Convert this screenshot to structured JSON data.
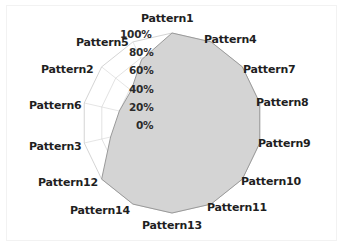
{
  "chart_data": {
    "type": "radar",
    "title": "",
    "subtitle": "",
    "xlabel": "",
    "ylabel": "",
    "grid": true,
    "legend": "none",
    "rlim": [
      0,
      100
    ],
    "tick_labels": [
      "0%",
      "20%",
      "40%",
      "60%",
      "80%",
      "100%"
    ],
    "tick_values": [
      0,
      20,
      40,
      60,
      80,
      100
    ],
    "categories": [
      "Pattern1",
      "Pattern4",
      "Pattern7",
      "Pattern8",
      "Pattern9",
      "Pattern10",
      "Pattern11",
      "Pattern13",
      "Pattern14",
      "Pattern12",
      "Pattern3",
      "Pattern6",
      "Pattern2",
      "Pattern5"
    ],
    "values": [
      100,
      100,
      100,
      100,
      100,
      100,
      100,
      100,
      100,
      100,
      70,
      60,
      58,
      78
    ],
    "series": [
      {
        "name": "Coverage",
        "values": [
          100,
          100,
          100,
          100,
          100,
          100,
          100,
          100,
          100,
          100,
          70,
          60,
          58,
          78
        ],
        "fill_color": "#d4d4d4",
        "line_color": "#9a9a9a"
      }
    ],
    "grid_color": "#cfcfcf",
    "background_color": "#ffffff",
    "center": {
      "x": 172,
      "y": 123
    },
    "radius_px": 90
  },
  "labels": {
    "ticks": [
      {
        "text": "100%",
        "x": 120,
        "y": 28
      },
      {
        "text": "80%",
        "x": 129,
        "y": 46
      },
      {
        "text": "60%",
        "x": 129,
        "y": 64
      },
      {
        "text": "40%",
        "x": 129,
        "y": 83
      },
      {
        "text": "20%",
        "x": 129,
        "y": 101
      },
      {
        "text": "0%",
        "x": 136,
        "y": 119
      }
    ],
    "categories": [
      {
        "text": "Pattern1",
        "x": 141,
        "y": 12,
        "align": "left"
      },
      {
        "text": "Pattern4",
        "x": 204,
        "y": 33,
        "align": "left"
      },
      {
        "text": "Pattern7",
        "x": 243,
        "y": 63,
        "align": "left"
      },
      {
        "text": "Pattern8",
        "x": 256,
        "y": 96,
        "align": "left"
      },
      {
        "text": "Pattern9",
        "x": 258,
        "y": 137,
        "align": "left"
      },
      {
        "text": "Pattern10",
        "x": 241,
        "y": 175,
        "align": "left"
      },
      {
        "text": "Pattern11",
        "x": 207,
        "y": 201,
        "align": "left"
      },
      {
        "text": "Pattern13",
        "x": 142,
        "y": 219,
        "align": "left"
      },
      {
        "text": "Pattern14",
        "x": 70,
        "y": 204,
        "align": "left"
      },
      {
        "text": "Pattern12",
        "x": 38,
        "y": 176,
        "align": "left"
      },
      {
        "text": "Pattern3",
        "x": 29,
        "y": 140,
        "align": "left"
      },
      {
        "text": "Pattern6",
        "x": 29,
        "y": 99,
        "align": "left"
      },
      {
        "text": "Pattern2",
        "x": 41,
        "y": 63,
        "align": "left"
      },
      {
        "text": "Pattern5",
        "x": 76,
        "y": 36,
        "align": "left"
      }
    ]
  }
}
